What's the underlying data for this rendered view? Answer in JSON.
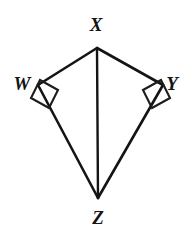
{
  "figure": {
    "kind": "geometry-diagram",
    "shape_name": "kite",
    "background_color": "#ffffff",
    "stroke_color": "#141414",
    "labels": {
      "top": "X",
      "left": "W",
      "right": "Y",
      "bottom": "Z"
    },
    "vertices": [
      {
        "name": "X",
        "label": "X",
        "x": 97,
        "y": 48,
        "label_x": 96,
        "label_y": 31
      },
      {
        "name": "W",
        "label": "W",
        "x": 38,
        "y": 85,
        "label_x": 22,
        "label_y": 90
      },
      {
        "name": "Y",
        "label": "Y",
        "x": 163,
        "y": 85,
        "label_x": 172,
        "label_y": 90
      },
      {
        "name": "Z",
        "label": "Z",
        "x": 98,
        "y": 198,
        "label_x": 98,
        "label_y": 224
      }
    ],
    "edges": [
      {
        "name": "XW",
        "from": "X",
        "to": "W"
      },
      {
        "name": "XY",
        "from": "X",
        "to": "Y"
      },
      {
        "name": "WZ",
        "from": "W",
        "to": "Z"
      },
      {
        "name": "YZ",
        "from": "Y",
        "to": "Z"
      }
    ],
    "diagonals": [
      {
        "name": "XZ",
        "from": "X",
        "to": "Z"
      }
    ],
    "right_angle_marks": [
      {
        "at": "W",
        "points": "40,80 58,90 49,108 31,98"
      },
      {
        "at": "Y",
        "points": "161,80 143,90 152,108 170,98"
      }
    ]
  }
}
